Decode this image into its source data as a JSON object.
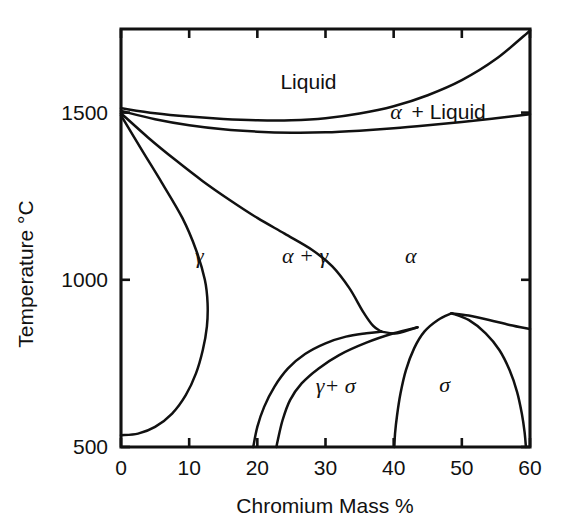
{
  "chart_data": {
    "type": "line",
    "title": "",
    "subtitle": "",
    "xlabel": "Chromium Mass %",
    "ylabel": "Temperature °C",
    "xlim": [
      0,
      60
    ],
    "ylim": [
      500,
      1750
    ],
    "grid": false,
    "legend": "none",
    "x_ticks": [
      0,
      10,
      20,
      30,
      40,
      50,
      60
    ],
    "x_tick_labels": [
      "0",
      "10",
      "20",
      "30",
      "40",
      "50",
      "60"
    ],
    "y_ticks": [
      500,
      1000,
      1500
    ],
    "y_tick_labels": [
      "500",
      "1000",
      "1500"
    ],
    "annotations": [
      {
        "text": "Liquid",
        "x": 27.5,
        "y": 1570,
        "style": "roman"
      },
      {
        "text": "α + Liquid",
        "x": 46.5,
        "y": 1480,
        "style": "mixed"
      },
      {
        "text": "γ",
        "x": 11.5,
        "y": 1050,
        "style": "italic"
      },
      {
        "text": "α + γ",
        "x": 27.0,
        "y": 1050,
        "style": "italic"
      },
      {
        "text": "α",
        "x": 42.5,
        "y": 1050,
        "style": "italic"
      },
      {
        "text": "γ+ σ",
        "x": 31.5,
        "y": 660,
        "style": "italic"
      },
      {
        "text": "σ",
        "x": 47.5,
        "y": 665,
        "style": "italic"
      }
    ],
    "series": [
      {
        "name": "liquidus",
        "comment": "upper boundary of Liquid field; from ~1513C at 0% dipping then rising to top-right corner",
        "points": [
          [
            0,
            1513
          ],
          [
            5,
            1498
          ],
          [
            10,
            1488
          ],
          [
            15,
            1481
          ],
          [
            20,
            1477
          ],
          [
            25,
            1477
          ],
          [
            30,
            1483
          ],
          [
            35,
            1497
          ],
          [
            40,
            1519
          ],
          [
            45,
            1552
          ],
          [
            50,
            1597
          ],
          [
            55,
            1660
          ],
          [
            60,
            1745
          ]
        ]
      },
      {
        "name": "solidus",
        "comment": "lower boundary of alpha+Liquid field",
        "points": [
          [
            0,
            1505
          ],
          [
            5,
            1480
          ],
          [
            10,
            1462
          ],
          [
            15,
            1450
          ],
          [
            20,
            1443
          ],
          [
            25,
            1440
          ],
          [
            30,
            1441
          ],
          [
            35,
            1446
          ],
          [
            40,
            1453
          ],
          [
            45,
            1462
          ],
          [
            50,
            1472
          ],
          [
            55,
            1483
          ],
          [
            60,
            1495
          ]
        ]
      },
      {
        "name": "gamma-loop-right",
        "comment": "alpha / alpha+gamma boundary descending from 1500C at 0% to eutectoid junction near 38% 860C",
        "points": [
          [
            0,
            1498
          ],
          [
            4,
            1425
          ],
          [
            8,
            1358
          ],
          [
            12,
            1295
          ],
          [
            16,
            1238
          ],
          [
            20,
            1185
          ],
          [
            24,
            1138
          ],
          [
            28,
            1090
          ],
          [
            31,
            1040
          ],
          [
            33.5,
            975
          ],
          [
            35.5,
            905
          ],
          [
            37.0,
            862
          ],
          [
            38.2,
            845
          ]
        ]
      },
      {
        "name": "gamma-loop-left",
        "comment": "gamma / alpha+gamma boundary: bulges right to ~13% near 1000C then curves back to ~19% at 500C",
        "points": [
          [
            0,
            1492
          ],
          [
            3,
            1390
          ],
          [
            6,
            1290
          ],
          [
            9,
            1185
          ],
          [
            11,
            1090
          ],
          [
            12.3,
            1000
          ],
          [
            12.7,
            930
          ],
          [
            12.6,
            860
          ],
          [
            12.0,
            790
          ],
          [
            11.0,
            720
          ],
          [
            9.5,
            655
          ],
          [
            7.5,
            600
          ],
          [
            5.0,
            560
          ],
          [
            2.5,
            540
          ],
          [
            0,
            535
          ]
        ]
      },
      {
        "name": "gamma-sigma-left-leg",
        "comment": "steep curve descending from the gamma loop to bottom axis near 19%",
        "points": [
          [
            38.2,
            845
          ],
          [
            36.0,
            840
          ],
          [
            33.0,
            830
          ],
          [
            30.0,
            810
          ],
          [
            27.0,
            778
          ],
          [
            24.5,
            735
          ],
          [
            22.5,
            680
          ],
          [
            21.0,
            620
          ],
          [
            20.0,
            560
          ],
          [
            19.4,
            500
          ]
        ]
      },
      {
        "name": "gamma-sigma-right-leg",
        "comment": "second steep curve to bottom axis near 22.5%",
        "points": [
          [
            43.5,
            858
          ],
          [
            40.0,
            840
          ],
          [
            36.0,
            812
          ],
          [
            32.0,
            775
          ],
          [
            29.0,
            735
          ],
          [
            26.5,
            690
          ],
          [
            24.8,
            640
          ],
          [
            23.7,
            580
          ],
          [
            23.0,
            520
          ],
          [
            22.8,
            500
          ]
        ]
      },
      {
        "name": "sigma-dome-left",
        "comment": "left side of the sigma single-phase dome, foot near 40%",
        "points": [
          [
            48.5,
            900
          ],
          [
            46.5,
            880
          ],
          [
            44.5,
            845
          ],
          [
            43.0,
            795
          ],
          [
            41.8,
            730
          ],
          [
            41.0,
            660
          ],
          [
            40.5,
            595
          ],
          [
            40.2,
            540
          ],
          [
            40.1,
            500
          ]
        ]
      },
      {
        "name": "sigma-dome-right",
        "comment": "right side of the sigma single-phase dome, foot near 59%",
        "points": [
          [
            48.5,
            900
          ],
          [
            51.0,
            880
          ],
          [
            53.5,
            840
          ],
          [
            55.5,
            790
          ],
          [
            57.0,
            730
          ],
          [
            58.1,
            665
          ],
          [
            58.8,
            600
          ],
          [
            59.2,
            545
          ],
          [
            59.4,
            500
          ]
        ]
      },
      {
        "name": "alpha-sigma-boundary",
        "comment": "alpha / alpha+sigma boundary running from dome apex to the right edge",
        "points": [
          [
            48.5,
            900
          ],
          [
            51.0,
            893
          ],
          [
            54.0,
            880
          ],
          [
            57.0,
            865
          ],
          [
            60,
            853
          ]
        ]
      },
      {
        "name": "eutectoid-tieline",
        "comment": "short near-horizontal tie-line joining the gamma loop foot to the dome apex region",
        "points": [
          [
            38.2,
            845
          ],
          [
            40.5,
            840
          ],
          [
            43.5,
            858
          ]
        ]
      }
    ]
  },
  "axis": {
    "x_title": "Chromium Mass %",
    "y_title": "Temperature °C"
  }
}
